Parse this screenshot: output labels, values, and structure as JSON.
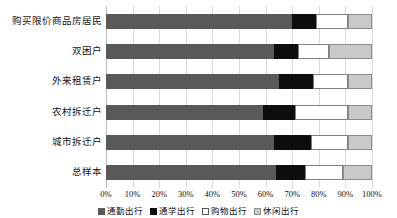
{
  "chart_data": {
    "type": "bar",
    "orientation": "horizontal",
    "stacked": true,
    "stack_mode": "percent",
    "title": "",
    "xlabel": "",
    "ylabel": "",
    "xlim": [
      0,
      100
    ],
    "grid": true,
    "legend_position": "bottom",
    "xticks": [
      "0%",
      "10%",
      "20%",
      "30%",
      "40%",
      "50%",
      "60%",
      "70%",
      "80%",
      "90%",
      "100%"
    ],
    "xtick_values": [
      0,
      10,
      20,
      30,
      40,
      50,
      60,
      70,
      80,
      90,
      100
    ],
    "categories": [
      "购买限价商品房居民",
      "双困户",
      "外来租赁户",
      "农村拆迁户",
      "城市拆迁户",
      "总样本"
    ],
    "series": [
      {
        "name": "通勤出行",
        "color": "#595959",
        "values": [
          70,
          63,
          65,
          59,
          63,
          64
        ]
      },
      {
        "name": "通学出行",
        "color": "#0d0d0d",
        "values": [
          9,
          9,
          13,
          12,
          14,
          11
        ]
      },
      {
        "name": "购物出行",
        "color": "#ffffff",
        "values": [
          12,
          12,
          13,
          20,
          14,
          14
        ]
      },
      {
        "name": "休闲出行",
        "color": "#c9c9c9",
        "values": [
          9,
          16,
          9,
          9,
          9,
          11
        ]
      }
    ]
  },
  "legend": {
    "items": [
      {
        "label": "通勤出行",
        "swatch": "commute"
      },
      {
        "label": "通学出行",
        "swatch": "school"
      },
      {
        "label": "购物出行",
        "swatch": "shopping"
      },
      {
        "label": "休闲出行",
        "swatch": "leisure"
      }
    ]
  }
}
